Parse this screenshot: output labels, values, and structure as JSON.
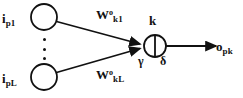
{
  "figure": {
    "background_color": "#ffffff",
    "stroke_color": "#111111"
  },
  "labels": {
    "input_first": {
      "base": "i",
      "sub": "p1"
    },
    "input_last": {
      "base": "i",
      "sub": "pL"
    },
    "weight_first": {
      "base": "W",
      "sup": "o",
      "sub": "k1"
    },
    "weight_last": {
      "base": "W",
      "sup": "o",
      "sub": "kL"
    },
    "node_index": "k",
    "node_threshold": "γ",
    "node_slope": "δ",
    "output": {
      "base": "o",
      "sub": "pk"
    },
    "ellipsis": "⋮"
  },
  "diagram_data": {
    "type": "diagram",
    "nodes": [
      {
        "name": "input-node-1",
        "shape": "circle",
        "cx": 44,
        "cy": 17,
        "r": 13,
        "filled": false
      },
      {
        "name": "input-node-L",
        "shape": "circle",
        "cx": 44,
        "cy": 77,
        "r": 13,
        "filled": false
      },
      {
        "name": "neuron-node-k",
        "shape": "circle-bisected",
        "cx": 155,
        "cy": 46,
        "r": 11,
        "filled": false
      }
    ],
    "edges": [
      {
        "name": "edge-input1-to-neuron",
        "from": "input-node-1",
        "to": "neuron-node-k",
        "label": "W_k1^o",
        "arrow": true
      },
      {
        "name": "edge-inputL-to-neuron",
        "from": "input-node-L",
        "to": "neuron-node-k",
        "label": "W_kL^o",
        "arrow": true
      },
      {
        "name": "edge-neuron-to-output",
        "from": "neuron-node-k",
        "to": "output",
        "label": "o_pk",
        "arrow": true
      }
    ]
  }
}
